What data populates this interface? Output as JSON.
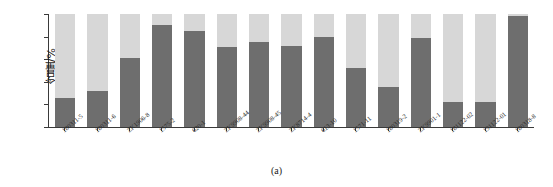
{
  "chart_data": {
    "type": "bar",
    "subtype": "stacked-100",
    "title": "",
    "caption": "(a)",
    "xlabel": "",
    "ylabel": "含量/%",
    "ylim": [
      0,
      100
    ],
    "yticks": [
      0,
      20,
      40,
      60,
      80,
      100
    ],
    "grid": false,
    "legend": "none",
    "categories": [
      "180311-5",
      "180311-6",
      "ZK1906-8",
      "1575-2",
      "620-1",
      "ZK9908-44",
      "ZK9908-45",
      "ZK8714-4",
      "613-10",
      "1571-11",
      "180319-2",
      "ZK9901-1",
      "181122-02",
      "191122-01",
      "180318-8"
    ],
    "series": [
      {
        "name": "下部分",
        "color": "#6e6e6e",
        "values": [
          26,
          32,
          61,
          90,
          85,
          71,
          75,
          72,
          80,
          52,
          35,
          79,
          22,
          22,
          98
        ]
      },
      {
        "name": "上部分",
        "color": "#d7d7d7",
        "values": [
          74,
          68,
          39,
          10,
          15,
          29,
          25,
          28,
          20,
          48,
          65,
          21,
          78,
          78,
          2
        ]
      }
    ]
  },
  "colors": {
    "series_dark": "#6e6e6e",
    "series_light": "#d7d7d7",
    "axis": "#3a3a3a",
    "background": "#ffffff"
  }
}
